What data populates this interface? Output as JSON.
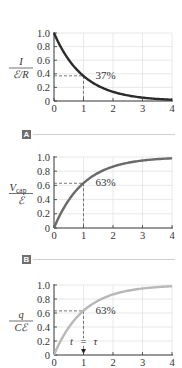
{
  "chart_data": [
    {
      "type": "line",
      "title": "",
      "xlabel": "t/τ",
      "ylabel": "I / (ℰ/R)",
      "ylabel_num": "I",
      "ylabel_den": "ℰ/R",
      "xlim": [
        0,
        4
      ],
      "ylim": [
        0,
        1.0
      ],
      "x_ticks": [
        "0",
        "1",
        "2",
        "3",
        "4"
      ],
      "y_ticks": [
        "0",
        "0.2",
        "0.4",
        "0.6",
        "0.8",
        "1.0"
      ],
      "grid": true,
      "series": [
        {
          "name": "current decay",
          "function": "exp(-x)",
          "color": "#2b2b2b",
          "x": [
            0,
            0.5,
            1,
            1.5,
            2,
            2.5,
            3,
            3.5,
            4
          ],
          "values": [
            1.0,
            0.61,
            0.37,
            0.22,
            0.14,
            0.08,
            0.05,
            0.03,
            0.02
          ]
        }
      ],
      "annotation": {
        "text": "37%",
        "x": 1,
        "y": 0.37
      },
      "section_label": "A"
    },
    {
      "type": "line",
      "title": "",
      "xlabel": "t/τ",
      "ylabel": "V_cap / ℰ",
      "ylabel_num": "V",
      "ylabel_num_sub": "cap",
      "ylabel_den": "ℰ",
      "xlim": [
        0,
        4
      ],
      "ylim": [
        0,
        1.0
      ],
      "x_ticks": [
        "0",
        "1",
        "2",
        "3",
        "4"
      ],
      "y_ticks": [
        "0",
        "0.2",
        "0.4",
        "0.6",
        "0.8",
        "1.0"
      ],
      "grid": true,
      "series": [
        {
          "name": "capacitor voltage",
          "function": "1-exp(-x)",
          "color": "#6a6a6a",
          "x": [
            0,
            0.5,
            1,
            1.5,
            2,
            2.5,
            3,
            3.5,
            4
          ],
          "values": [
            0,
            0.39,
            0.63,
            0.78,
            0.86,
            0.92,
            0.95,
            0.97,
            0.98
          ]
        }
      ],
      "annotation": {
        "text": "63%",
        "x": 1,
        "y": 0.63
      },
      "section_label": "B"
    },
    {
      "type": "line",
      "title": "",
      "xlabel": "t/τ",
      "ylabel": "q / Cℰ",
      "ylabel_num": "q",
      "ylabel_den": "Cℰ",
      "xlim": [
        0,
        4
      ],
      "ylim": [
        0,
        1.0
      ],
      "x_ticks": [
        "0",
        "1",
        "2",
        "3",
        "4"
      ],
      "y_ticks": [
        "0",
        "0.2",
        "0.4",
        "0.6",
        "0.8",
        "1.0"
      ],
      "grid": true,
      "series": [
        {
          "name": "capacitor charge",
          "function": "1-exp(-x)",
          "color": "#b8b8b8",
          "x": [
            0,
            0.5,
            1,
            1.5,
            2,
            2.5,
            3,
            3.5,
            4
          ],
          "values": [
            0,
            0.39,
            0.63,
            0.78,
            0.86,
            0.92,
            0.95,
            0.97,
            0.98
          ]
        }
      ],
      "annotation": {
        "text": "63%",
        "x": 1,
        "y": 0.63
      },
      "arrow_label": "t = τ"
    }
  ],
  "labels": {
    "section_a": "A",
    "section_b": "B",
    "plot1_annotation": "37%",
    "plot2_annotation": "63%",
    "plot3_annotation": "63%",
    "plot3_arrow_label_t": "t",
    "plot3_arrow_label_eq": "=",
    "plot3_arrow_label_tau": "τ",
    "plot1_ylabel_num": "I",
    "plot1_ylabel_den": "ℰ/R",
    "plot2_ylabel_num": "V",
    "plot2_ylabel_sub": "cap",
    "plot2_ylabel_den": "ℰ",
    "plot3_ylabel_num": "q",
    "plot3_ylabel_den": "Cℰ"
  },
  "colors": {
    "curve1": "#2b2b2b",
    "curve2": "#6a6a6a",
    "curve3": "#b8b8b8",
    "grid": "#e2e2e2",
    "axis": "#333333",
    "badge": "#6e6e6e",
    "separator": "#cfcfcf"
  }
}
